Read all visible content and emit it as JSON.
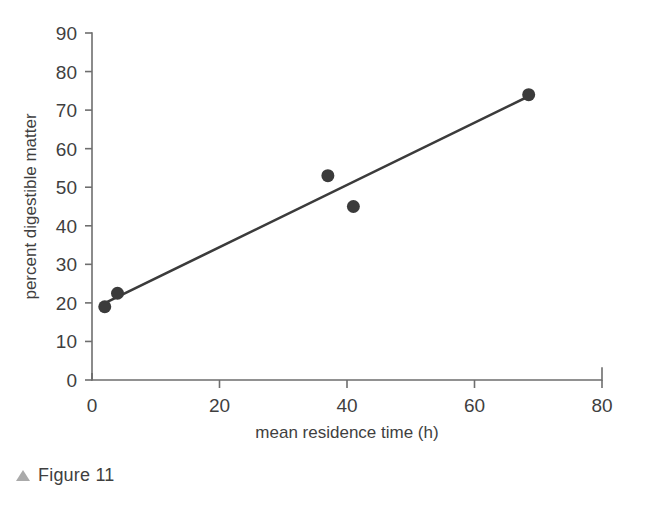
{
  "figure": {
    "caption_marker": "triangle-up-icon",
    "caption_text": "Figure 11",
    "caption_marker_color": "#aaaaaa"
  },
  "colors": {
    "marker": "#3b3b3b",
    "trend_line": "#3b3b3b",
    "axis": "#6e6e6e",
    "text": "#3f3f3f",
    "background": "#ffffff"
  },
  "chart_data": {
    "type": "scatter",
    "title": "",
    "xlabel": "mean residence time (h)",
    "ylabel": "percent digestible matter",
    "xlim": [
      0,
      80
    ],
    "ylim": [
      0,
      90
    ],
    "xticks": [
      0,
      20,
      40,
      60,
      80
    ],
    "yticks": [
      0,
      10,
      20,
      30,
      40,
      50,
      60,
      70,
      80,
      90
    ],
    "xtick_labels": [
      "0",
      "20",
      "40",
      "60",
      "80"
    ],
    "ytick_labels": [
      "0",
      "10",
      "20",
      "30",
      "40",
      "50",
      "60",
      "70",
      "80",
      "90"
    ],
    "grid": false,
    "legend": null,
    "series": [
      {
        "name": "observations",
        "marker": "circle",
        "color": "#3b3b3b",
        "points": [
          {
            "x": 2.0,
            "y": 19.0
          },
          {
            "x": 4.0,
            "y": 22.5
          },
          {
            "x": 37.0,
            "y": 53.0
          },
          {
            "x": 41.0,
            "y": 45.0
          },
          {
            "x": 68.5,
            "y": 74.0
          }
        ]
      }
    ],
    "trend_line": {
      "name": "linear fit",
      "color": "#3b3b3b",
      "x_start": 1.6,
      "y_start": 19.6,
      "x_end": 68.5,
      "y_end": 73.6
    }
  }
}
